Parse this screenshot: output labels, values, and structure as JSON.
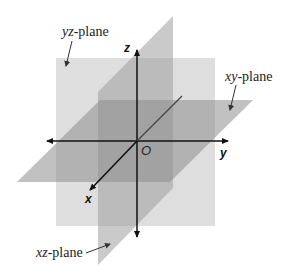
{
  "diagram": {
    "colors": {
      "yz_plane": "#d8d8d8",
      "xz_plane": "#b9b9b9",
      "xy_plane": "#a9a9a9",
      "axis": "#111111",
      "background": "#ffffff"
    },
    "planes": [
      {
        "id": "yz",
        "italic": "yz",
        "suffix": "-plane"
      },
      {
        "id": "xy",
        "italic": "xy",
        "suffix": "-plane"
      },
      {
        "id": "xz",
        "italic": "xz",
        "suffix": "-plane"
      }
    ],
    "axes": {
      "x": "x",
      "y": "y",
      "z": "z",
      "origin": "O"
    }
  }
}
